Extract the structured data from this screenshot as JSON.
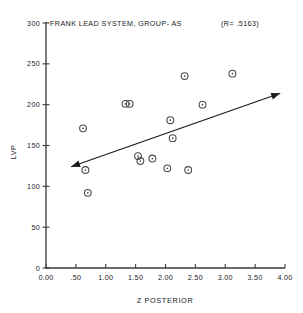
{
  "chart_data": {
    "type": "scatter",
    "title": "FRANK LEAD SYSTEM, GROUP- AS",
    "annotation": "(R=   .5163)",
    "correlation_label": "(R=",
    "correlation_value": ".5163",
    "xlabel": "Z POSTERIOR",
    "ylabel": "LVP",
    "xlim": [
      0.0,
      4.0
    ],
    "ylim": [
      0,
      300
    ],
    "grid": false,
    "legend": "none",
    "xticks": [
      0.0,
      0.5,
      1.0,
      1.5,
      2.0,
      2.5,
      3.0,
      3.5,
      4.0
    ],
    "xtick_labels": [
      "0.00",
      ".50",
      "1.00",
      "1.50",
      "2.00",
      "2.50",
      "3.00",
      "3.50",
      "4.00"
    ],
    "yticks": [
      0,
      50,
      100,
      150,
      200,
      250,
      300
    ],
    "ytick_labels": [
      "0",
      "50",
      "100",
      "150",
      "200",
      "250",
      "300"
    ],
    "points": [
      {
        "x": 0.62,
        "y": 171
      },
      {
        "x": 0.66,
        "y": 120
      },
      {
        "x": 0.7,
        "y": 92
      },
      {
        "x": 1.33,
        "y": 201
      },
      {
        "x": 1.4,
        "y": 201
      },
      {
        "x": 1.54,
        "y": 137
      },
      {
        "x": 1.58,
        "y": 131
      },
      {
        "x": 1.78,
        "y": 134
      },
      {
        "x": 2.03,
        "y": 122
      },
      {
        "x": 2.08,
        "y": 181
      },
      {
        "x": 2.12,
        "y": 159
      },
      {
        "x": 2.32,
        "y": 235
      },
      {
        "x": 2.38,
        "y": 120
      },
      {
        "x": 2.62,
        "y": 200
      },
      {
        "x": 3.12,
        "y": 238
      }
    ],
    "trend_line": {
      "x_start": 0.42,
      "y_start": 124,
      "x_end": 3.92,
      "y_end": 214,
      "arrow_start": true,
      "arrow_end": true
    }
  }
}
